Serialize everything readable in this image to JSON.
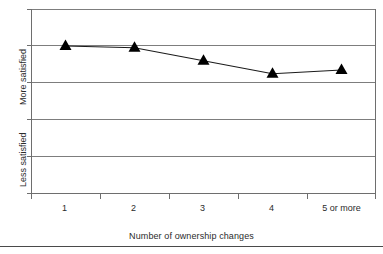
{
  "chart_data": {
    "type": "line",
    "title": "",
    "subtitle": "",
    "xlabel": "Number of ownership changes",
    "ylabel": "",
    "categories": [
      "1",
      "2",
      "3",
      "4",
      "5 or more"
    ],
    "series": [
      {
        "name": "Satisfaction",
        "values": [
          4.0,
          3.95,
          3.6,
          3.25,
          3.35
        ]
      }
    ],
    "y_axis_labels": [
      "More satisfied",
      "Less satisfied"
    ],
    "ylim": [
      0,
      5
    ],
    "ytick_values": [
      0,
      1,
      2,
      3,
      4,
      5
    ],
    "grid": true,
    "grid_axis": "y",
    "legend": "none",
    "marker": "triangle",
    "marker_color": "#000000",
    "line_color": "#1a1a1a",
    "axis_color": "#6e6e6e",
    "grid_color": "#7a7a7a",
    "background": "#ffffff",
    "annotations": []
  },
  "axes": {
    "x_title": "Number of ownership changes",
    "y_label_top": "More satisfied",
    "y_label_bottom": "Less satisfied",
    "x_tick_labels": [
      "1",
      "2",
      "3",
      "4",
      "5 or more"
    ]
  },
  "figure": {
    "bottom_rule": true
  }
}
